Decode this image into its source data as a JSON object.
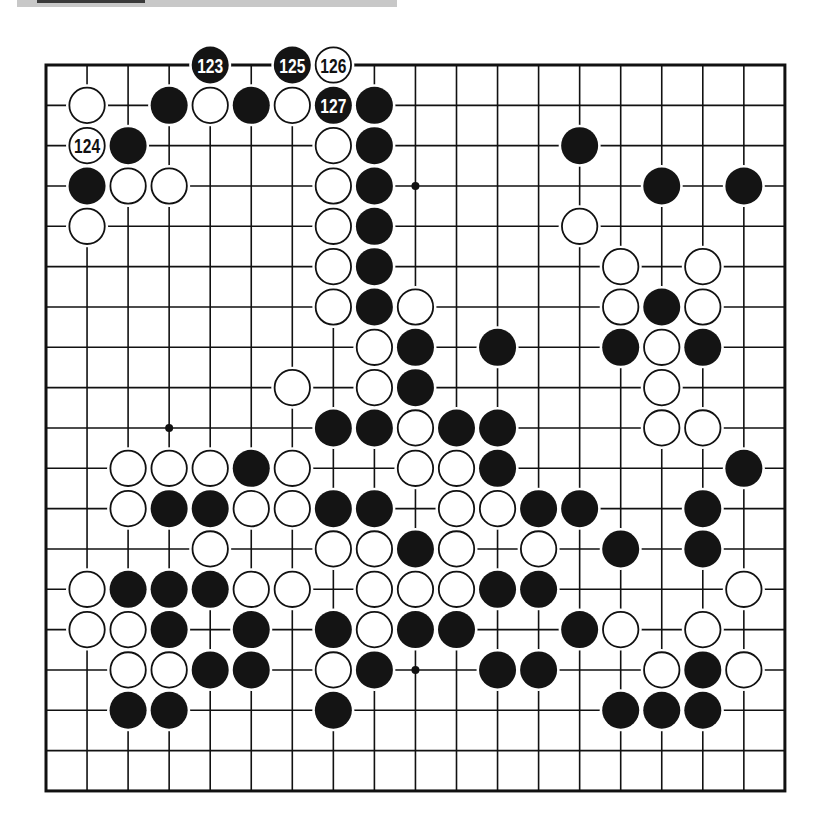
{
  "figure": {
    "type": "go-board-diagram",
    "size": 19,
    "origin": {
      "x": 46,
      "y": 65
    },
    "spacing": {
      "x": 41.05,
      "y": 40.33
    },
    "colors": {
      "line": "#111111",
      "black": "#141414",
      "white": "#ffffff",
      "border": "#111111"
    },
    "star_points": [
      [
        3,
        3
      ],
      [
        3,
        9
      ],
      [
        3,
        15
      ],
      [
        9,
        3
      ],
      [
        9,
        9
      ],
      [
        9,
        15
      ],
      [
        15,
        3
      ],
      [
        15,
        9
      ],
      [
        15,
        15
      ]
    ],
    "stones": [
      {
        "row": 0,
        "col": 4,
        "color": "B",
        "label": "123"
      },
      {
        "row": 0,
        "col": 6,
        "color": "B",
        "label": "125"
      },
      {
        "row": 0,
        "col": 7,
        "color": "W",
        "label": "126"
      },
      {
        "row": 1,
        "col": 1,
        "color": "W"
      },
      {
        "row": 1,
        "col": 3,
        "color": "B"
      },
      {
        "row": 1,
        "col": 4,
        "color": "W"
      },
      {
        "row": 1,
        "col": 5,
        "color": "B"
      },
      {
        "row": 1,
        "col": 6,
        "color": "W"
      },
      {
        "row": 1,
        "col": 7,
        "color": "B",
        "label": "127"
      },
      {
        "row": 1,
        "col": 8,
        "color": "B"
      },
      {
        "row": 2,
        "col": 1,
        "color": "W",
        "label": "124"
      },
      {
        "row": 2,
        "col": 2,
        "color": "B"
      },
      {
        "row": 2,
        "col": 7,
        "color": "W"
      },
      {
        "row": 2,
        "col": 8,
        "color": "B"
      },
      {
        "row": 2,
        "col": 13,
        "color": "B"
      },
      {
        "row": 3,
        "col": 1,
        "color": "B"
      },
      {
        "row": 3,
        "col": 2,
        "color": "W"
      },
      {
        "row": 3,
        "col": 3,
        "color": "W"
      },
      {
        "row": 3,
        "col": 7,
        "color": "W"
      },
      {
        "row": 3,
        "col": 8,
        "color": "B"
      },
      {
        "row": 3,
        "col": 15,
        "color": "B"
      },
      {
        "row": 3,
        "col": 17,
        "color": "B"
      },
      {
        "row": 4,
        "col": 1,
        "color": "W"
      },
      {
        "row": 4,
        "col": 7,
        "color": "W"
      },
      {
        "row": 4,
        "col": 8,
        "color": "B"
      },
      {
        "row": 4,
        "col": 13,
        "color": "W"
      },
      {
        "row": 5,
        "col": 7,
        "color": "W"
      },
      {
        "row": 5,
        "col": 8,
        "color": "B"
      },
      {
        "row": 5,
        "col": 14,
        "color": "W"
      },
      {
        "row": 5,
        "col": 16,
        "color": "W"
      },
      {
        "row": 6,
        "col": 7,
        "color": "W"
      },
      {
        "row": 6,
        "col": 8,
        "color": "B"
      },
      {
        "row": 6,
        "col": 9,
        "color": "W"
      },
      {
        "row": 6,
        "col": 14,
        "color": "W"
      },
      {
        "row": 6,
        "col": 15,
        "color": "B"
      },
      {
        "row": 6,
        "col": 16,
        "color": "W"
      },
      {
        "row": 7,
        "col": 8,
        "color": "W"
      },
      {
        "row": 7,
        "col": 9,
        "color": "B"
      },
      {
        "row": 7,
        "col": 11,
        "color": "B"
      },
      {
        "row": 7,
        "col": 14,
        "color": "B"
      },
      {
        "row": 7,
        "col": 15,
        "color": "W"
      },
      {
        "row": 7,
        "col": 16,
        "color": "B"
      },
      {
        "row": 8,
        "col": 6,
        "color": "W"
      },
      {
        "row": 8,
        "col": 8,
        "color": "W"
      },
      {
        "row": 8,
        "col": 9,
        "color": "B"
      },
      {
        "row": 8,
        "col": 15,
        "color": "W"
      },
      {
        "row": 9,
        "col": 7,
        "color": "B"
      },
      {
        "row": 9,
        "col": 8,
        "color": "B"
      },
      {
        "row": 9,
        "col": 9,
        "color": "W"
      },
      {
        "row": 9,
        "col": 10,
        "color": "B"
      },
      {
        "row": 9,
        "col": 11,
        "color": "B"
      },
      {
        "row": 9,
        "col": 15,
        "color": "W"
      },
      {
        "row": 9,
        "col": 16,
        "color": "W"
      },
      {
        "row": 10,
        "col": 2,
        "color": "W"
      },
      {
        "row": 10,
        "col": 3,
        "color": "W"
      },
      {
        "row": 10,
        "col": 4,
        "color": "W"
      },
      {
        "row": 10,
        "col": 5,
        "color": "B"
      },
      {
        "row": 10,
        "col": 6,
        "color": "W"
      },
      {
        "row": 10,
        "col": 9,
        "color": "W"
      },
      {
        "row": 10,
        "col": 10,
        "color": "W"
      },
      {
        "row": 10,
        "col": 11,
        "color": "B"
      },
      {
        "row": 10,
        "col": 17,
        "color": "B"
      },
      {
        "row": 11,
        "col": 2,
        "color": "W"
      },
      {
        "row": 11,
        "col": 3,
        "color": "B"
      },
      {
        "row": 11,
        "col": 4,
        "color": "B"
      },
      {
        "row": 11,
        "col": 5,
        "color": "W"
      },
      {
        "row": 11,
        "col": 6,
        "color": "W"
      },
      {
        "row": 11,
        "col": 7,
        "color": "B"
      },
      {
        "row": 11,
        "col": 8,
        "color": "B"
      },
      {
        "row": 11,
        "col": 10,
        "color": "W"
      },
      {
        "row": 11,
        "col": 11,
        "color": "W"
      },
      {
        "row": 11,
        "col": 12,
        "color": "B"
      },
      {
        "row": 11,
        "col": 13,
        "color": "B"
      },
      {
        "row": 11,
        "col": 16,
        "color": "B"
      },
      {
        "row": 12,
        "col": 4,
        "color": "W"
      },
      {
        "row": 12,
        "col": 7,
        "color": "W"
      },
      {
        "row": 12,
        "col": 8,
        "color": "W"
      },
      {
        "row": 12,
        "col": 9,
        "color": "B"
      },
      {
        "row": 12,
        "col": 10,
        "color": "W"
      },
      {
        "row": 12,
        "col": 12,
        "color": "W"
      },
      {
        "row": 12,
        "col": 14,
        "color": "B"
      },
      {
        "row": 12,
        "col": 16,
        "color": "B"
      },
      {
        "row": 13,
        "col": 1,
        "color": "W"
      },
      {
        "row": 13,
        "col": 2,
        "color": "B"
      },
      {
        "row": 13,
        "col": 3,
        "color": "B"
      },
      {
        "row": 13,
        "col": 4,
        "color": "B"
      },
      {
        "row": 13,
        "col": 5,
        "color": "W"
      },
      {
        "row": 13,
        "col": 6,
        "color": "W"
      },
      {
        "row": 13,
        "col": 8,
        "color": "W"
      },
      {
        "row": 13,
        "col": 9,
        "color": "W"
      },
      {
        "row": 13,
        "col": 10,
        "color": "W"
      },
      {
        "row": 13,
        "col": 11,
        "color": "B"
      },
      {
        "row": 13,
        "col": 12,
        "color": "B"
      },
      {
        "row": 13,
        "col": 17,
        "color": "W"
      },
      {
        "row": 14,
        "col": 1,
        "color": "W"
      },
      {
        "row": 14,
        "col": 2,
        "color": "W"
      },
      {
        "row": 14,
        "col": 3,
        "color": "B"
      },
      {
        "row": 14,
        "col": 5,
        "color": "B"
      },
      {
        "row": 14,
        "col": 7,
        "color": "B"
      },
      {
        "row": 14,
        "col": 8,
        "color": "W"
      },
      {
        "row": 14,
        "col": 9,
        "color": "B"
      },
      {
        "row": 14,
        "col": 10,
        "color": "B"
      },
      {
        "row": 14,
        "col": 13,
        "color": "B"
      },
      {
        "row": 14,
        "col": 14,
        "color": "W"
      },
      {
        "row": 14,
        "col": 16,
        "color": "W"
      },
      {
        "row": 15,
        "col": 2,
        "color": "W"
      },
      {
        "row": 15,
        "col": 3,
        "color": "W"
      },
      {
        "row": 15,
        "col": 4,
        "color": "B"
      },
      {
        "row": 15,
        "col": 5,
        "color": "B"
      },
      {
        "row": 15,
        "col": 7,
        "color": "W"
      },
      {
        "row": 15,
        "col": 8,
        "color": "B"
      },
      {
        "row": 15,
        "col": 11,
        "color": "B"
      },
      {
        "row": 15,
        "col": 12,
        "color": "B"
      },
      {
        "row": 15,
        "col": 15,
        "color": "W"
      },
      {
        "row": 15,
        "col": 16,
        "color": "B"
      },
      {
        "row": 15,
        "col": 17,
        "color": "W"
      },
      {
        "row": 16,
        "col": 2,
        "color": "B"
      },
      {
        "row": 16,
        "col": 3,
        "color": "B"
      },
      {
        "row": 16,
        "col": 7,
        "color": "B"
      },
      {
        "row": 16,
        "col": 14,
        "color": "B"
      },
      {
        "row": 16,
        "col": 15,
        "color": "B"
      },
      {
        "row": 16,
        "col": 16,
        "color": "B"
      }
    ],
    "move_labels": [
      "123",
      "124",
      "125",
      "126",
      "127"
    ]
  }
}
